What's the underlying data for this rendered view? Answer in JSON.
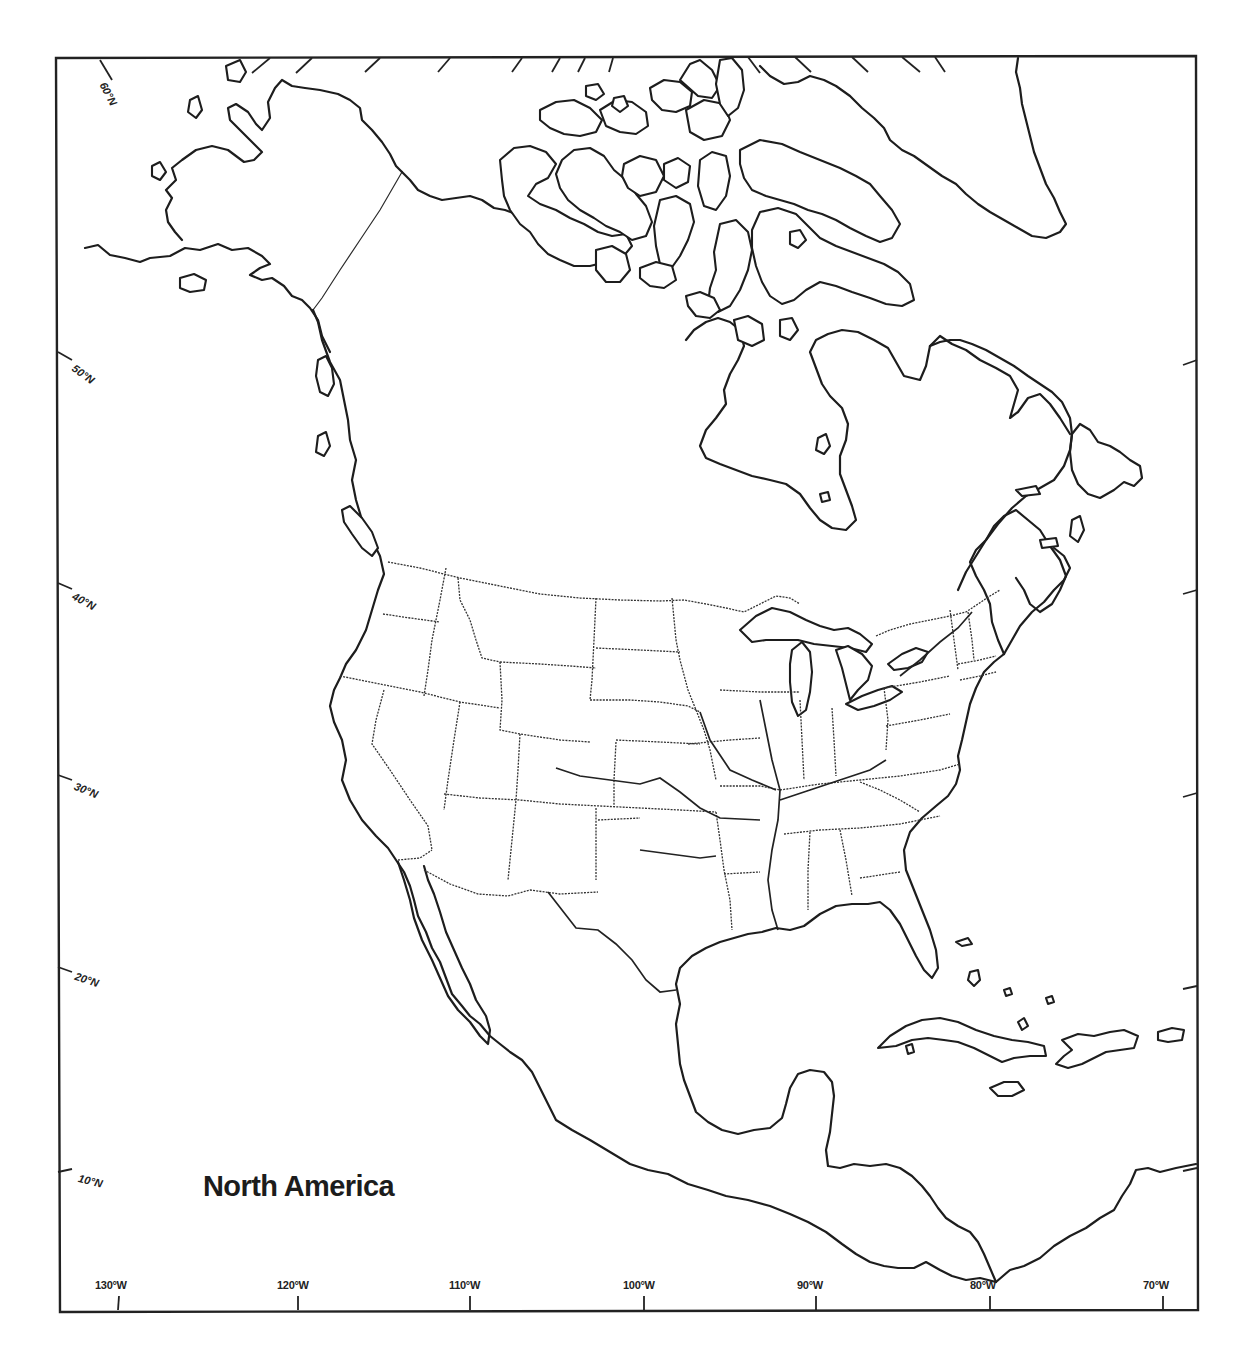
{
  "map": {
    "title": "North America",
    "type": "blank outline map",
    "colors": {
      "background": "#ffffff",
      "ink": "#1d1d1d"
    },
    "latitude_labels": [
      {
        "label": "60°N",
        "x": 108,
        "y": 80,
        "rotate": 62
      },
      {
        "label": "50°N",
        "x": 77,
        "y": 362,
        "rotate": 36
      },
      {
        "label": "40°N",
        "x": 76,
        "y": 590,
        "rotate": 28
      },
      {
        "label": "30°N",
        "x": 77,
        "y": 780,
        "rotate": 22
      },
      {
        "label": "20°N",
        "x": 77,
        "y": 970,
        "rotate": 18
      },
      {
        "label": "10°N",
        "x": 80,
        "y": 1172,
        "rotate": 14
      }
    ],
    "longitude_labels": [
      {
        "label": "130°W",
        "x": 95,
        "y": 1279
      },
      {
        "label": "120°W",
        "x": 277,
        "y": 1279
      },
      {
        "label": "110°W",
        "x": 449,
        "y": 1279
      },
      {
        "label": "100°W",
        "x": 623,
        "y": 1279
      },
      {
        "label": "90°W",
        "x": 797,
        "y": 1279
      },
      {
        "label": "80°W",
        "x": 970,
        "y": 1279
      },
      {
        "label": "70°W",
        "x": 1143,
        "y": 1279
      }
    ]
  }
}
